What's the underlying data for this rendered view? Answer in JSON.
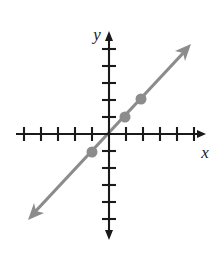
{
  "figure": {
    "name": "coordinate-plane-line-graph",
    "width": 224,
    "height": 253,
    "background_color": "#ffffff"
  },
  "axes": {
    "x_axis": {
      "label": "x",
      "color": "#1a1a1a",
      "origin_px": {
        "x": 109,
        "y": 134
      },
      "start_px": {
        "x": 16,
        "y": 134
      },
      "end_px": {
        "x": 205,
        "y": 134
      },
      "arrow_end": "right",
      "tick_spacing_px": 17,
      "tick_length_px": 14,
      "ticks_negative": 5,
      "ticks_positive": 5,
      "label_px": {
        "x": 208,
        "y": 152
      }
    },
    "y_axis": {
      "label": "y",
      "color": "#1a1a1a",
      "start_px": {
        "x": 109,
        "y": 33
      },
      "end_px": {
        "x": 109,
        "y": 238
      },
      "arrow_end": "both",
      "tick_spacing_px": 17,
      "tick_length_px": 14,
      "ticks_positive": 5,
      "ticks_negative": 5,
      "label_px": {
        "x": 95,
        "y": 35
      }
    }
  },
  "line": {
    "color": "#8c8c8c",
    "stroke_width": 3.2,
    "slope": 1,
    "y_intercept": 0,
    "equation": "y = x",
    "arrow_heads": "both",
    "start_px": {
      "x": 33,
      "y": 214
    },
    "end_px": {
      "x": 186,
      "y": 50
    }
  },
  "points": [
    {
      "name": "point-negative-one",
      "x": -1,
      "y": -1,
      "px": {
        "x": 92,
        "y": 152
      },
      "color": "#8c8c8c",
      "radius": 5.5
    },
    {
      "name": "point-one",
      "x": 1,
      "y": 1,
      "px": {
        "x": 125,
        "y": 117
      },
      "color": "#8c8c8c",
      "radius": 5.5
    },
    {
      "name": "point-two",
      "x": 2,
      "y": 2,
      "px": {
        "x": 141,
        "y": 99
      },
      "color": "#8c8c8c",
      "radius": 5.5
    }
  ],
  "colors": {
    "axis": "#1a1a1a",
    "line": "#8c8c8c",
    "point": "#8c8c8c",
    "background": "#ffffff"
  }
}
